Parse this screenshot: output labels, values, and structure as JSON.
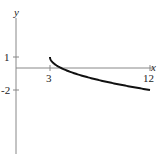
{
  "chart_data": {
    "type": "line",
    "title": "",
    "xlabel": "x",
    "ylabel": "y",
    "function": "y = 1 - sqrt(x - 3)",
    "x_ticks": [
      3,
      12
    ],
    "x_tick_labels": [
      "3",
      "12"
    ],
    "y_ticks": [
      1,
      -2
    ],
    "y_tick_labels": [
      "1",
      "-2"
    ],
    "series": [
      {
        "name": "curve",
        "x": [
          3,
          3.25,
          4,
          5,
          6,
          7,
          8,
          9,
          10,
          11,
          12
        ],
        "y": [
          1,
          0.5,
          0,
          -0.41,
          -0.73,
          -1,
          -1.24,
          -1.45,
          -1.65,
          -1.83,
          -2
        ]
      }
    ],
    "xlim": [
      0,
      12.5
    ],
    "ylim": [
      -6.5,
      4.5
    ],
    "grid": false,
    "colors": {
      "axis": "#888888",
      "curve": "#111111",
      "text": "#222222"
    }
  }
}
